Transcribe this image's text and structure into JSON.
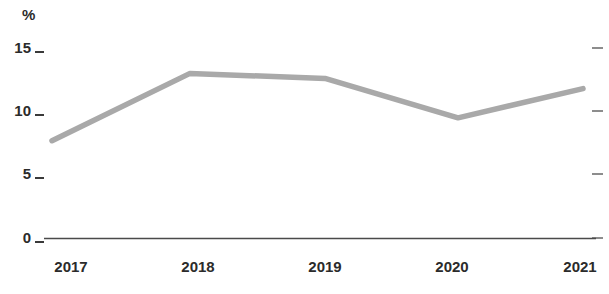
{
  "chart_data": {
    "type": "line",
    "title": "",
    "subtitle": "",
    "xlabel": "",
    "ylabel": "%",
    "unit_label": "%",
    "categories": [
      "2017",
      "2018",
      "2019",
      "2020",
      "2021"
    ],
    "values": [
      7.7,
      13.0,
      12.6,
      9.5,
      11.8
    ],
    "series": [
      {
        "name": "",
        "values": [
          7.7,
          13.0,
          12.6,
          9.5,
          11.8
        ]
      }
    ],
    "ylim": [
      0,
      15
    ],
    "yticks": [
      0,
      5,
      10,
      15
    ],
    "ytick_labels": [
      "0",
      "5",
      "10",
      "15"
    ],
    "xtick_labels": [
      "2017",
      "2018",
      "2019",
      "2020",
      "2021"
    ],
    "grid": false,
    "legend": false,
    "legend_position": "none",
    "line_color": "#a9a9a9",
    "axis_color": "#4a4a4a",
    "tick_color": "#8d8d8d",
    "text_color": "#2b2b2b",
    "background_color": "#ffffff",
    "right_axis_ticks": [
      "15",
      "10",
      "5",
      "0"
    ],
    "annotations": []
  },
  "axis": {
    "y_unit": "%",
    "y_ticks": [
      {
        "label": "15"
      },
      {
        "label": "10"
      },
      {
        "label": "5"
      },
      {
        "label": "0"
      }
    ],
    "x_ticks": [
      {
        "label": "2017"
      },
      {
        "label": "2018"
      },
      {
        "label": "2019"
      },
      {
        "label": "2020"
      },
      {
        "label": "2021"
      }
    ]
  }
}
